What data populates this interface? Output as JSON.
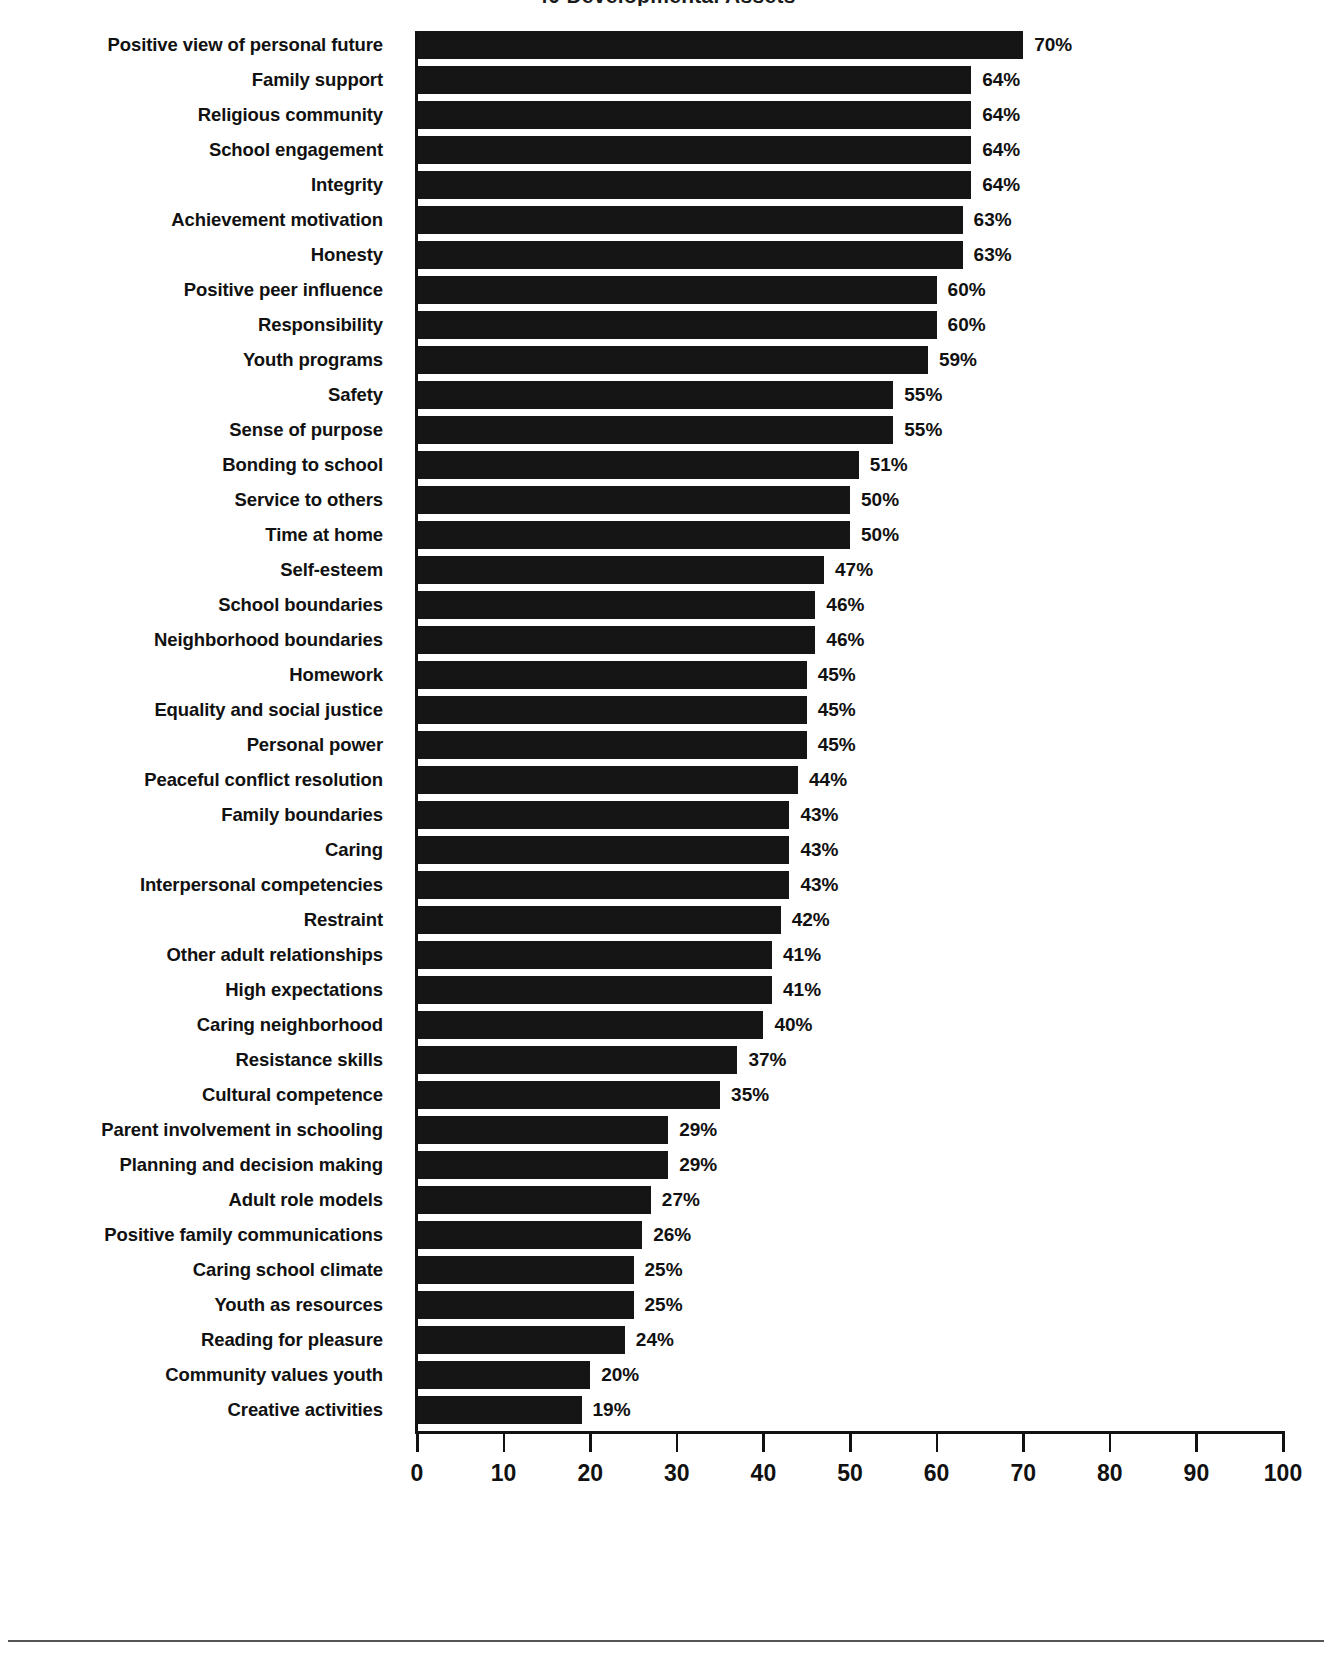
{
  "title_sliver": "40 Developmental Assets",
  "chart_data": {
    "type": "bar",
    "orientation": "horizontal",
    "title": "40 Developmental Assets",
    "xlabel": "",
    "ylabel": "",
    "xlim": [
      0,
      100
    ],
    "xticks": [
      "0",
      "10",
      "20",
      "30",
      "40",
      "50",
      "60",
      "70",
      "80",
      "90",
      "100"
    ],
    "grid": false,
    "legend": null,
    "value_suffix": "%",
    "bar_color": "#151515",
    "categories": [
      "Positive view of personal future",
      "Family support",
      "Religious community",
      "School engagement",
      "Integrity",
      "Achievement motivation",
      "Honesty",
      "Positive peer influence",
      "Responsibility",
      "Youth programs",
      "Safety",
      "Sense of purpose",
      "Bonding to school",
      "Service to others",
      "Time at home",
      "Self-esteem",
      "School boundaries",
      "Neighborhood boundaries",
      "Homework",
      "Equality and social justice",
      "Personal power",
      "Peaceful conflict resolution",
      "Family boundaries",
      "Caring",
      "Interpersonal competencies",
      "Restraint",
      "Other adult relationships",
      "High expectations",
      "Caring neighborhood",
      "Resistance skills",
      "Cultural competence",
      "Parent involvement in schooling",
      "Planning and decision making",
      "Adult role models",
      "Positive family communications",
      "Caring school climate",
      "Youth as resources",
      "Reading for pleasure",
      "Community values youth",
      "Creative activities"
    ],
    "values": [
      70,
      64,
      64,
      64,
      64,
      63,
      63,
      60,
      60,
      59,
      55,
      55,
      51,
      50,
      50,
      47,
      46,
      46,
      45,
      45,
      45,
      44,
      43,
      43,
      43,
      42,
      41,
      41,
      40,
      37,
      35,
      29,
      29,
      27,
      26,
      25,
      25,
      24,
      20,
      19
    ],
    "value_labels": [
      "70%",
      "64%",
      "64%",
      "64%",
      "64%",
      "63%",
      "63%",
      "60%",
      "60%",
      "59%",
      "55%",
      "55%",
      "51%",
      "50%",
      "50%",
      "47%",
      "46%",
      "46%",
      "45%",
      "45%",
      "45%",
      "44%",
      "43%",
      "43%",
      "43%",
      "42%",
      "41%",
      "41%",
      "40%",
      "37%",
      "35%",
      "29%",
      "29%",
      "27%",
      "26%",
      "25%",
      "25%",
      "24%",
      "20%",
      "19%"
    ]
  }
}
